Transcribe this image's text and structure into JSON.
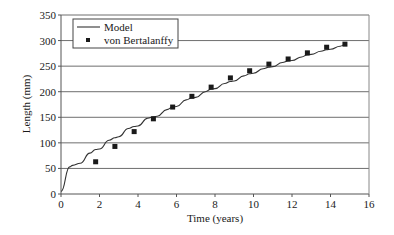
{
  "chart_data": {
    "type": "line",
    "title": "",
    "xlabel": "Time (years)",
    "ylabel": "Length (mm)",
    "xlim": [
      0,
      16
    ],
    "ylim": [
      0,
      350
    ],
    "xticks": [
      0,
      2,
      4,
      6,
      8,
      10,
      12,
      14,
      16
    ],
    "yticks": [
      0,
      50,
      100,
      150,
      200,
      250,
      300,
      350
    ],
    "grid": "horizontal",
    "legend": {
      "placement": "top-left",
      "entries": [
        "Model",
        "von Bertalanffy"
      ]
    },
    "series": [
      {
        "name": "Model",
        "kind": "line",
        "x": [
          0,
          0.45,
          0.6,
          1.0,
          1.5,
          1.8,
          2.0,
          2.5,
          2.8,
          3.0,
          3.5,
          3.8,
          4.0,
          4.5,
          4.8,
          5.0,
          5.5,
          5.8,
          6.0,
          6.5,
          6.8,
          7.0,
          7.5,
          7.8,
          8.0,
          8.5,
          8.8,
          9.0,
          9.5,
          9.8,
          10.0,
          10.5,
          10.8,
          11.0,
          11.5,
          11.8,
          12.0,
          12.5,
          12.8,
          13.0,
          13.5,
          13.8,
          14.0,
          14.5,
          14.8
        ],
        "y": [
          5,
          53,
          56,
          60,
          80,
          87,
          88,
          105,
          110,
          112,
          128,
          132,
          133,
          148,
          151,
          152,
          165,
          170,
          171,
          184,
          188,
          189,
          200,
          205,
          206,
          216,
          220,
          221,
          231,
          235,
          236,
          245,
          248,
          249,
          257,
          260,
          261,
          268,
          272,
          273,
          279,
          282,
          283,
          289,
          293
        ]
      },
      {
        "name": "von Bertalanffy",
        "kind": "scatter",
        "x": [
          1.8,
          2.8,
          3.8,
          4.8,
          5.8,
          6.8,
          7.8,
          8.8,
          9.8,
          10.8,
          11.8,
          12.8,
          13.8,
          14.75
        ],
        "y": [
          63,
          93,
          122,
          147,
          170,
          191,
          209,
          227,
          241,
          254,
          264,
          276,
          287,
          293
        ]
      }
    ]
  }
}
